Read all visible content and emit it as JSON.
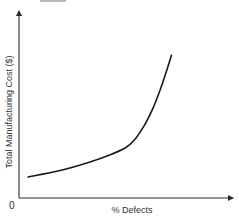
{
  "chart_data": {
    "type": "line",
    "title": "",
    "xlabel": "% Defects",
    "ylabel": "Total Manufacturing Cost ($)",
    "origin_label": "0",
    "xlim": [
      0,
      10
    ],
    "ylim": [
      0,
      10
    ],
    "grid": false,
    "legend": "none",
    "x_ticks": [],
    "y_ticks": [],
    "series": [
      {
        "name": "Total Manufacturing Cost",
        "color": "#1a1a1a",
        "points": [
          {
            "x": 0.44,
            "y": 1.15
          },
          {
            "x": 2.0,
            "y": 1.5
          },
          {
            "x": 3.45,
            "y": 1.97
          },
          {
            "x": 4.4,
            "y": 2.35
          },
          {
            "x": 5.15,
            "y": 2.73
          },
          {
            "x": 5.6,
            "y": 3.17
          },
          {
            "x": 6.1,
            "y": 4.0
          },
          {
            "x": 6.5,
            "y": 4.9
          },
          {
            "x": 6.85,
            "y": 5.9
          },
          {
            "x": 7.15,
            "y": 6.9
          },
          {
            "x": 7.4,
            "y": 7.8
          }
        ]
      }
    ]
  }
}
